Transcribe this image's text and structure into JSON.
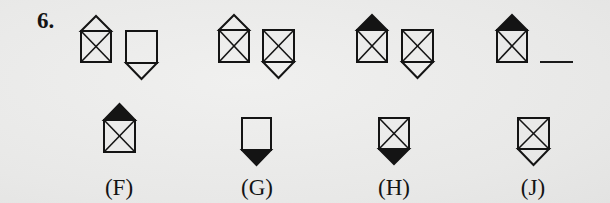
{
  "question": {
    "number": "6.",
    "sequence": [
      {
        "id": "seq-1",
        "x": 81,
        "y": 31,
        "w": 30,
        "h": 31,
        "cross": true,
        "top_tri": "outline",
        "bottom_tri": "none"
      },
      {
        "id": "seq-2",
        "x": 126,
        "y": 31,
        "w": 31,
        "h": 32,
        "cross": false,
        "top_tri": "none",
        "bottom_tri": "outline"
      },
      {
        "id": "seq-3",
        "x": 219,
        "y": 30,
        "w": 30,
        "h": 32,
        "cross": true,
        "top_tri": "outline",
        "bottom_tri": "none"
      },
      {
        "id": "seq-4",
        "x": 263,
        "y": 30,
        "w": 31,
        "h": 32,
        "cross": true,
        "top_tri": "none",
        "bottom_tri": "outline"
      },
      {
        "id": "seq-5",
        "x": 357,
        "y": 30,
        "w": 30,
        "h": 32,
        "cross": true,
        "top_tri": "filled",
        "bottom_tri": "none"
      },
      {
        "id": "seq-6",
        "x": 402,
        "y": 30,
        "w": 31,
        "h": 32,
        "cross": true,
        "top_tri": "none",
        "bottom_tri": "outline"
      },
      {
        "id": "seq-7",
        "x": 497,
        "y": 30,
        "w": 30,
        "h": 32,
        "cross": true,
        "top_tri": "filled",
        "bottom_tri": "none"
      }
    ],
    "blank": {
      "x": 540,
      "y": 61,
      "w": 33
    }
  },
  "answers": [
    {
      "label": "(F)",
      "label_x": 119,
      "label_y": 176,
      "x": 104,
      "y": 120,
      "w": 31,
      "h": 32,
      "cross": true,
      "top_tri": "filled",
      "bottom_tri": "none"
    },
    {
      "label": "(G)",
      "label_x": 257,
      "label_y": 176,
      "x": 242,
      "y": 118,
      "w": 29,
      "h": 32,
      "cross": false,
      "top_tri": "none",
      "bottom_tri": "filled"
    },
    {
      "label": "(H)",
      "label_x": 394,
      "label_y": 176,
      "x": 379,
      "y": 118,
      "w": 30,
      "h": 31,
      "cross": true,
      "top_tri": "none",
      "bottom_tri": "filled"
    },
    {
      "label": "(J)",
      "label_x": 533,
      "label_y": 176,
      "x": 518,
      "y": 118,
      "w": 31,
      "h": 31,
      "cross": true,
      "top_tri": "none",
      "bottom_tri": "outline"
    }
  ],
  "colors": {
    "ink": "#141414",
    "background": "#ebebea"
  }
}
